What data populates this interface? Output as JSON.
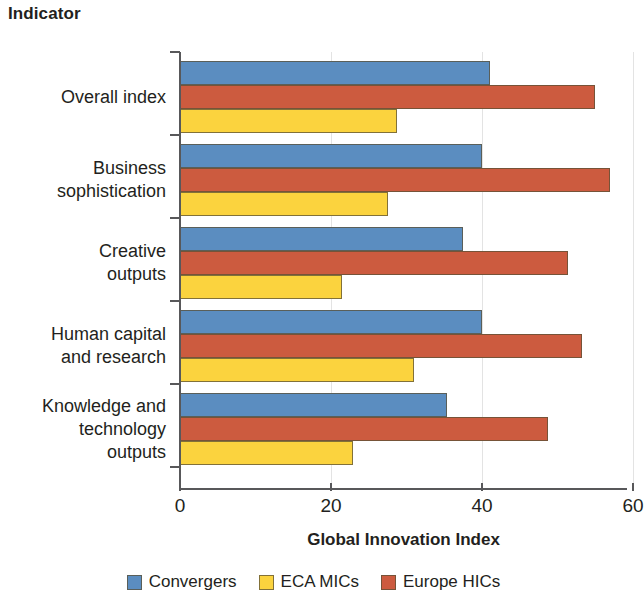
{
  "chart_data": {
    "type": "bar",
    "orientation": "horizontal",
    "title": "Indicator",
    "xlabel": "Global Innovation Index",
    "ylabel": "Indicator",
    "xlim": [
      0,
      60
    ],
    "xticks": [
      0,
      20,
      40,
      60
    ],
    "xtick_labels": [
      "0",
      "20",
      "40",
      "60"
    ],
    "grid": true,
    "grid_axis": "x",
    "legend_position": "bottom",
    "categories": [
      "Overall index",
      "Business\nsophistication",
      "Creative\noutputs",
      "Human capital\nand research",
      "Knowledge and\ntechnology\noutputs"
    ],
    "series": [
      {
        "name": "Convergers",
        "color": "#5B8DC0",
        "values": [
          41,
          40,
          37.5,
          40,
          35.4
        ]
      },
      {
        "name": "ECA MICs",
        "color": "#FBD33E",
        "values": [
          28.7,
          27.5,
          21.5,
          31,
          22.9
        ]
      },
      {
        "name": "Europe HICs",
        "color": "#CC5B3F",
        "values": [
          55,
          57,
          51.4,
          53.2,
          48.7
        ]
      }
    ],
    "draw_order": [
      "Convergers",
      "Europe HICs",
      "ECA MICs"
    ]
  },
  "axis": {
    "x_title": "Global Innovation Index",
    "y_title": "Indicator",
    "tick_labels": [
      "0",
      "20",
      "40",
      "60"
    ]
  },
  "legend": {
    "items": [
      {
        "label": "Convergers",
        "color": "#5B8DC0"
      },
      {
        "label": "ECA MICs",
        "color": "#FBD33E"
      },
      {
        "label": "Europe HICs",
        "color": "#CC5B3F"
      }
    ]
  }
}
